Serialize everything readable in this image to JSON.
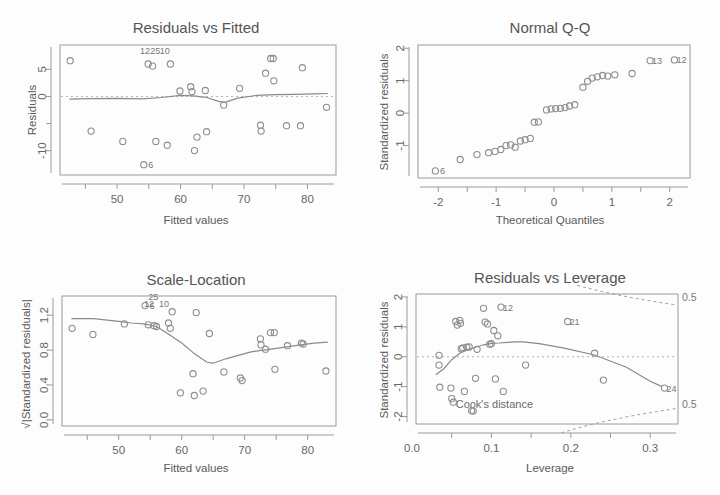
{
  "figure": {
    "kind": "r-lm-diagnostic-quad-panel",
    "background": "#fdfdfd",
    "ink": "#8e8e8e"
  },
  "panels": {
    "residuals_vs_fitted": {
      "title": "Residuals vs Fitted",
      "xlabel": "Fitted values",
      "ylabel": "Residuals"
    },
    "normal_qq": {
      "title": "Normal Q-Q",
      "xlabel": "Theoretical Quantiles",
      "ylabel": "Standardized residuals"
    },
    "scale_location": {
      "title": "Scale-Location",
      "xlabel": "Fitted values",
      "ylabel": "√|Standardized residuals|"
    },
    "residuals_vs_leverage": {
      "title": "Residuals vs Leverage",
      "xlabel": "Leverage",
      "ylabel": "Standardized residuals",
      "cooks_label": "Cook's distance",
      "contour_labels": [
        "0.5",
        "0.5"
      ]
    }
  },
  "chart_data": [
    {
      "id": "residuals_vs_fitted",
      "type": "scatter",
      "title": "Residuals vs Fitted",
      "xlabel": "Fitted values",
      "ylabel": "Residuals",
      "xlim": [
        41.0,
        84.5
      ],
      "ylim": [
        -14.5,
        9.5
      ],
      "xticks": [
        50,
        60,
        70,
        80
      ],
      "yticks": [
        5,
        0,
        -10
      ],
      "ytick_minor": [
        -5
      ],
      "grid": false,
      "legend": null,
      "reference_line": {
        "y": 0,
        "style": "dotted"
      },
      "smoother": {
        "name": "loess",
        "x": [
          42.5,
          46,
          50,
          54,
          57,
          60,
          62,
          64,
          66,
          67,
          69,
          72,
          75,
          78,
          81,
          83.2
        ],
        "y": [
          -0.5,
          -0.4,
          -0.35,
          -0.45,
          -0.2,
          0.2,
          0.1,
          -0.15,
          -0.9,
          -1.1,
          -0.3,
          0.2,
          0.35,
          0.4,
          0.5,
          0.55
        ]
      },
      "points": [
        {
          "x": 42.6,
          "y": 6.6
        },
        {
          "x": 45.9,
          "y": -6.4
        },
        {
          "x": 50.9,
          "y": -8.3
        },
        {
          "x": 54.2,
          "y": -12.6,
          "label": "6"
        },
        {
          "x": 54.9,
          "y": 6.0
        },
        {
          "x": 55.6,
          "y": 5.6
        },
        {
          "x": 56.1,
          "y": -8.3
        },
        {
          "x": 57.9,
          "y": -9.0
        },
        {
          "x": 58.4,
          "y": 6.0
        },
        {
          "x": 59.9,
          "y": 1.0
        },
        {
          "x": 61.6,
          "y": 1.8
        },
        {
          "x": 61.8,
          "y": 0.9
        },
        {
          "x": 62.2,
          "y": -10.0
        },
        {
          "x": 62.6,
          "y": -7.5
        },
        {
          "x": 63.9,
          "y": 1.1
        },
        {
          "x": 64.1,
          "y": -6.5
        },
        {
          "x": 66.8,
          "y": -1.6
        },
        {
          "x": 69.3,
          "y": 1.5
        },
        {
          "x": 72.6,
          "y": -5.3
        },
        {
          "x": 72.7,
          "y": -6.4
        },
        {
          "x": 73.4,
          "y": 4.3
        },
        {
          "x": 74.2,
          "y": 7.0
        },
        {
          "x": 74.6,
          "y": 7.0
        },
        {
          "x": 74.7,
          "y": 2.9
        },
        {
          "x": 76.7,
          "y": -5.4
        },
        {
          "x": 78.9,
          "y": -5.4
        },
        {
          "x": 79.2,
          "y": 5.3
        },
        {
          "x": 83.0,
          "y": -2.0
        }
      ],
      "point_labels": [
        {
          "text": "12",
          "x": 54.4,
          "y": 7.8
        },
        {
          "text": "25",
          "x": 56.0,
          "y": 7.9
        },
        {
          "text": "10",
          "x": 57.5,
          "y": 7.9
        }
      ]
    },
    {
      "id": "normal_qq",
      "type": "scatter",
      "title": "Normal Q-Q",
      "xlabel": "Theoretical Quantiles",
      "ylabel": "Standardized residuals",
      "xlim": [
        -2.35,
        2.35
      ],
      "ylim": [
        -2.0,
        2.1
      ],
      "xticks": [
        -2,
        -1,
        0,
        1,
        2
      ],
      "yticks": [
        -1,
        0,
        1,
        2
      ],
      "grid": false,
      "legend": null,
      "points": [
        {
          "x": -2.05,
          "y": -1.78,
          "label": "6"
        },
        {
          "x": -1.62,
          "y": -1.43
        },
        {
          "x": -1.33,
          "y": -1.28
        },
        {
          "x": -1.13,
          "y": -1.22
        },
        {
          "x": -1.02,
          "y": -1.18
        },
        {
          "x": -0.92,
          "y": -1.12
        },
        {
          "x": -0.83,
          "y": -1.0
        },
        {
          "x": -0.75,
          "y": -0.98
        },
        {
          "x": -0.67,
          "y": -1.05
        },
        {
          "x": -0.58,
          "y": -0.86
        },
        {
          "x": -0.5,
          "y": -0.82
        },
        {
          "x": -0.41,
          "y": -0.78
        },
        {
          "x": -0.34,
          "y": -0.28
        },
        {
          "x": -0.27,
          "y": -0.27
        },
        {
          "x": -0.13,
          "y": 0.1
        },
        {
          "x": -0.05,
          "y": 0.13
        },
        {
          "x": 0.03,
          "y": 0.14
        },
        {
          "x": 0.11,
          "y": 0.15
        },
        {
          "x": 0.19,
          "y": 0.17
        },
        {
          "x": 0.27,
          "y": 0.22
        },
        {
          "x": 0.36,
          "y": 0.26
        },
        {
          "x": 0.5,
          "y": 0.8
        },
        {
          "x": 0.58,
          "y": 0.98
        },
        {
          "x": 0.66,
          "y": 1.08
        },
        {
          "x": 0.75,
          "y": 1.12
        },
        {
          "x": 0.84,
          "y": 1.16
        },
        {
          "x": 0.93,
          "y": 1.14
        },
        {
          "x": 1.05,
          "y": 1.18
        },
        {
          "x": 1.35,
          "y": 1.22
        },
        {
          "x": 1.66,
          "y": 1.62,
          "label": "13"
        },
        {
          "x": 2.08,
          "y": 1.64,
          "label": "12"
        }
      ]
    },
    {
      "id": "scale_location",
      "type": "scatter",
      "title": "Scale-Location",
      "xlabel": "Fitted values",
      "ylabel": "√|Standardized residuals|",
      "xlim": [
        41.0,
        84.5
      ],
      "ylim": [
        -0.07,
        1.42
      ],
      "xticks": [
        50,
        60,
        70,
        80
      ],
      "yticks": [
        0.0,
        0.4,
        0.8,
        1.2
      ],
      "grid": false,
      "legend": null,
      "smoother": {
        "name": "loess",
        "x": [
          42.5,
          46,
          50,
          52,
          54,
          56,
          58,
          60,
          62,
          64,
          65,
          67,
          69,
          71,
          73,
          75,
          78,
          81,
          83.2
        ],
        "y": [
          1.16,
          1.16,
          1.13,
          1.11,
          1.1,
          1.07,
          0.98,
          0.88,
          0.76,
          0.66,
          0.65,
          0.7,
          0.74,
          0.78,
          0.8,
          0.82,
          0.85,
          0.88,
          0.89
        ]
      },
      "points": [
        {
          "x": 42.6,
          "y": 1.05
        },
        {
          "x": 45.9,
          "y": 0.98
        },
        {
          "x": 50.9,
          "y": 1.1
        },
        {
          "x": 54.2,
          "y": 1.31,
          "label": "6"
        },
        {
          "x": 54.7,
          "y": 1.09
        },
        {
          "x": 55.6,
          "y": 1.08
        },
        {
          "x": 56.0,
          "y": 1.07
        },
        {
          "x": 57.9,
          "y": 1.11
        },
        {
          "x": 58.2,
          "y": 1.05
        },
        {
          "x": 58.5,
          "y": 1.24
        },
        {
          "x": 59.8,
          "y": 0.31
        },
        {
          "x": 61.8,
          "y": 0.53
        },
        {
          "x": 62.0,
          "y": 0.28
        },
        {
          "x": 62.3,
          "y": 1.23
        },
        {
          "x": 63.4,
          "y": 0.33
        },
        {
          "x": 64.4,
          "y": 0.99
        },
        {
          "x": 66.7,
          "y": 0.55
        },
        {
          "x": 69.3,
          "y": 0.48
        },
        {
          "x": 69.6,
          "y": 0.45
        },
        {
          "x": 72.5,
          "y": 0.93
        },
        {
          "x": 72.6,
          "y": 0.86
        },
        {
          "x": 73.3,
          "y": 0.81
        },
        {
          "x": 74.1,
          "y": 1.0
        },
        {
          "x": 74.7,
          "y": 1.0
        },
        {
          "x": 74.8,
          "y": 0.58
        },
        {
          "x": 76.8,
          "y": 0.85
        },
        {
          "x": 79.0,
          "y": 0.88
        },
        {
          "x": 79.3,
          "y": 0.87
        },
        {
          "x": 82.9,
          "y": 0.56
        }
      ],
      "point_labels": [
        {
          "text": "25",
          "x": 55.5,
          "y": 1.38
        },
        {
          "text": "12",
          "x": 54.8,
          "y": 1.29
        },
        {
          "text": "10",
          "x": 57.2,
          "y": 1.29
        }
      ]
    },
    {
      "id": "residuals_vs_leverage",
      "type": "scatter",
      "title": "Residuals vs Leverage",
      "xlabel": "Leverage",
      "ylabel": "Standardized residuals",
      "xlim": [
        0.005,
        0.335
      ],
      "ylim": [
        -2.25,
        2.1
      ],
      "xticks": [
        0.0,
        0.1,
        0.2,
        0.3
      ],
      "yticks": [
        -2,
        -1,
        0,
        1,
        2
      ],
      "grid": false,
      "legend": null,
      "reference_line": {
        "y": 0,
        "style": "dotted"
      },
      "cooks_contours": [
        {
          "level": "0.5",
          "side": "upper"
        },
        {
          "level": "0.5",
          "side": "lower"
        }
      ],
      "smoother": {
        "name": "loess",
        "x": [
          0.03,
          0.04,
          0.05,
          0.06,
          0.07,
          0.08,
          0.09,
          0.1,
          0.11,
          0.12,
          0.13,
          0.14,
          0.16,
          0.19,
          0.23,
          0.27,
          0.3,
          0.315
        ],
        "y": [
          -0.6,
          -0.4,
          -0.1,
          0.12,
          0.24,
          0.32,
          0.4,
          0.45,
          0.46,
          0.48,
          0.5,
          0.5,
          0.44,
          0.3,
          0.06,
          -0.35,
          -0.82,
          -1.0
        ]
      },
      "points": [
        {
          "x": 0.034,
          "y": 0.05
        },
        {
          "x": 0.034,
          "y": -0.28
        },
        {
          "x": 0.035,
          "y": -1.02
        },
        {
          "x": 0.049,
          "y": -1.05
        },
        {
          "x": 0.05,
          "y": -1.4
        },
        {
          "x": 0.052,
          "y": -1.52
        },
        {
          "x": 0.055,
          "y": 1.18
        },
        {
          "x": 0.057,
          "y": 1.06
        },
        {
          "x": 0.06,
          "y": 1.22
        },
        {
          "x": 0.061,
          "y": 1.12
        },
        {
          "x": 0.062,
          "y": 0.27
        },
        {
          "x": 0.064,
          "y": 0.3
        },
        {
          "x": 0.066,
          "y": -1.16
        },
        {
          "x": 0.069,
          "y": 0.32
        },
        {
          "x": 0.072,
          "y": 0.33
        },
        {
          "x": 0.075,
          "y": -1.8
        },
        {
          "x": 0.077,
          "y": -1.82
        },
        {
          "x": 0.08,
          "y": -0.72
        },
        {
          "x": 0.082,
          "y": 0.25
        },
        {
          "x": 0.09,
          "y": 1.62
        },
        {
          "x": 0.092,
          "y": 1.16
        },
        {
          "x": 0.095,
          "y": 1.1
        },
        {
          "x": 0.098,
          "y": 0.42
        },
        {
          "x": 0.1,
          "y": 0.44
        },
        {
          "x": 0.103,
          "y": 0.88
        },
        {
          "x": 0.105,
          "y": -0.74
        },
        {
          "x": 0.108,
          "y": 0.7
        },
        {
          "x": 0.112,
          "y": 1.66,
          "label": "12"
        },
        {
          "x": 0.115,
          "y": -1.16
        },
        {
          "x": 0.143,
          "y": -0.28
        },
        {
          "x": 0.196,
          "y": 1.18,
          "label": "21"
        },
        {
          "x": 0.23,
          "y": 0.12
        },
        {
          "x": 0.241,
          "y": -0.78
        },
        {
          "x": 0.318,
          "y": -1.05,
          "label": "24"
        }
      ]
    }
  ]
}
